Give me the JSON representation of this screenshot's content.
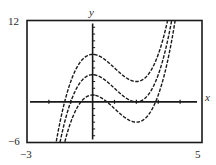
{
  "chart_data": {
    "type": "line",
    "title": "",
    "xlabel": "x",
    "ylabel": "y",
    "xlim": [
      -3,
      5
    ],
    "ylim": [
      -6,
      12
    ],
    "x_tick_labels": [
      "-3",
      "5"
    ],
    "y_tick_labels": [
      "12",
      "-6"
    ],
    "x_tick_step": 1,
    "y_tick_step": 1,
    "grid": false,
    "legend": null,
    "line_style": "dashed",
    "function_form": "y = x^3 - 3x^2 + C",
    "series": [
      {
        "name": "C = 7",
        "C": 7,
        "local_max": [
          0,
          7
        ],
        "local_min": [
          2,
          3
        ]
      },
      {
        "name": "C = 4",
        "C": 4,
        "local_max": [
          0,
          4
        ],
        "local_min": [
          2,
          0
        ]
      },
      {
        "name": "C = 1",
        "C": 1,
        "local_max": [
          0,
          1
        ],
        "local_min": [
          2,
          -3
        ]
      }
    ]
  },
  "labels": {
    "x_axis": "x",
    "y_axis": "y",
    "xmin": "−3",
    "xmax": "5",
    "ymin": "−6",
    "ymax": "12"
  },
  "colors": {
    "ink": "#1a1a1a",
    "background": "#ffffff"
  }
}
